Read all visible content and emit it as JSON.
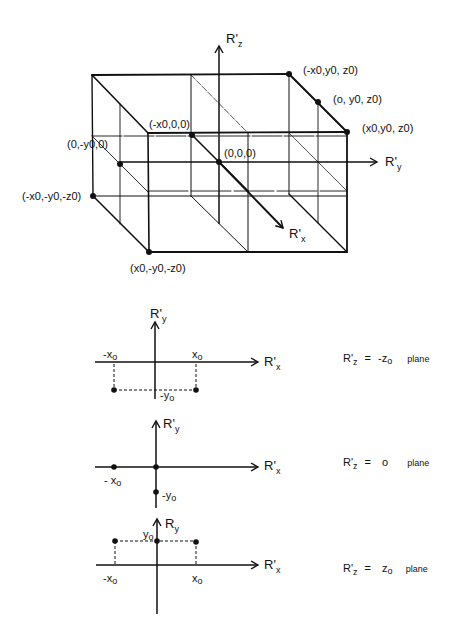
{
  "figure": {
    "box3d": {
      "axes": {
        "z": {
          "label": "R'",
          "sub": "z"
        },
        "y": {
          "label": "R'",
          "sub": "y"
        },
        "x": {
          "label": "R'",
          "sub": "x"
        }
      },
      "points": [
        {
          "id": "p_neg_x0_y0_z0",
          "text": "(-x0,y0, z0)"
        },
        {
          "id": "p_0_y0_z0",
          "text": "(o, y0, z0)"
        },
        {
          "id": "p_x0_y0_z0",
          "text": "(x0,y0, z0)"
        },
        {
          "id": "p_neg_x0_0_0",
          "text": "(-x0,0,0)"
        },
        {
          "id": "p_0_neg_y0_0",
          "text": "(0,-y0,0)"
        },
        {
          "id": "p_0_0_0",
          "text": "(0,0,0)"
        },
        {
          "id": "p_neg_x0_neg_y0_neg_z0",
          "text": "(-x0,-y0,-z0)"
        },
        {
          "id": "p_x0_neg_y0_neg_z0",
          "text": "(x0,-y0,-z0)"
        }
      ]
    },
    "planes": [
      {
        "name": "Rz = -z0 plane",
        "caption": {
          "lhs": "R'",
          "lhs_sub": "z",
          "eq": "=",
          "rhs": "-z",
          "rhs_sub": "o",
          "word": "plane"
        },
        "y_axis": {
          "label": "R'",
          "sub": "y"
        },
        "x_axis": {
          "label": "R'",
          "sub": "x"
        },
        "labels": {
          "neg_x": "-x",
          "neg_x_sub": "o",
          "pos_x": "x",
          "pos_x_sub": "o",
          "y_mark": "-y",
          "y_mark_sub": "o"
        }
      },
      {
        "name": "Rz = 0 plane",
        "caption": {
          "lhs": "R'",
          "lhs_sub": "z",
          "eq": "=",
          "rhs": "o",
          "rhs_sub": "",
          "word": "plane"
        },
        "y_axis": {
          "label": "R'",
          "sub": "y"
        },
        "x_axis": {
          "label": "R'",
          "sub": "x"
        },
        "labels": {
          "neg_x": "- x",
          "neg_x_sub": "o",
          "y_mark": "-y",
          "y_mark_sub": "o"
        }
      },
      {
        "name": "Rz = z0 plane",
        "caption": {
          "lhs": "R'",
          "lhs_sub": "z",
          "eq": "=",
          "rhs": "z",
          "rhs_sub": "o",
          "word": "plane"
        },
        "y_axis": {
          "label": "R",
          "sub": "y"
        },
        "x_axis": {
          "label": "R'",
          "sub": "x"
        },
        "labels": {
          "neg_x": "-x",
          "neg_x_sub": "o",
          "pos_x": "x",
          "pos_x_sub": "o",
          "y_mark": "y",
          "y_mark_sub": "o"
        }
      }
    ]
  }
}
